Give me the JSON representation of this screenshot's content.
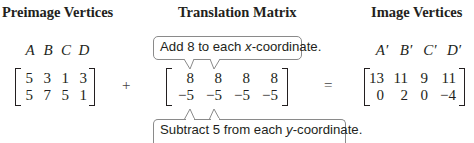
{
  "sections": {
    "preimage": {
      "heading": "Preimage Vertices",
      "labels": [
        "A",
        "B",
        "C",
        "D"
      ],
      "rows": [
        [
          "5",
          "3",
          "1",
          "3"
        ],
        [
          "5",
          "7",
          "5",
          "1"
        ]
      ]
    },
    "translation": {
      "heading": "Translation Matrix",
      "rows": [
        [
          "8",
          "8",
          "8",
          "8"
        ],
        [
          "−5",
          "−5",
          "−5",
          "−5"
        ]
      ],
      "callout_top": {
        "before": "Add 8 to each ",
        "var": "x",
        "after": "-coordinate."
      },
      "callout_bottom": {
        "before": "Subtract 5 from each ",
        "var": "y",
        "after": "-coordinate."
      }
    },
    "image": {
      "heading": "Image Vertices",
      "labels": [
        "A′",
        "B′",
        "C′",
        "D′"
      ],
      "rows": [
        [
          "13",
          "11",
          "9",
          "11"
        ],
        [
          "0",
          "2",
          "0",
          "−4"
        ]
      ]
    }
  },
  "operators": {
    "plus": "+",
    "equals": "="
  },
  "colors": {
    "text": "#231f20",
    "callout_border": "#8a8a8a"
  }
}
